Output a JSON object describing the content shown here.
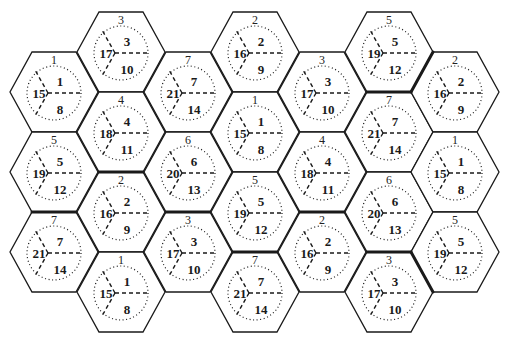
{
  "diagram": {
    "width": 510,
    "height": 345,
    "hex_half_width": 44,
    "hex_half_height": 40,
    "colors": {
      "background": "#ffffff",
      "stroke": "#1a1a1a",
      "text": "#1a1a1a"
    },
    "sector_rule": {
      "top_right": "n",
      "bottom_right": "n+7",
      "left": "n+14"
    },
    "cells": [
      {
        "id": "1",
        "cx": 54,
        "cy": 92,
        "cluster": "A",
        "sectors": {
          "top_right": "1",
          "left": "15",
          "bottom_right": "8"
        }
      },
      {
        "id": "5",
        "cx": 54,
        "cy": 172,
        "cluster": "A",
        "sectors": {
          "top_right": "5",
          "left": "19",
          "bottom_right": "12"
        }
      },
      {
        "id": "7",
        "cx": 54,
        "cy": 252,
        "cluster": "E",
        "sectors": {
          "top_right": "7",
          "left": "21",
          "bottom_right": "14"
        }
      },
      {
        "id": "3",
        "cx": 121,
        "cy": 52,
        "cluster": "A",
        "sectors": {
          "top_right": "3",
          "left": "17",
          "bottom_right": "10"
        }
      },
      {
        "id": "4",
        "cx": 121,
        "cy": 132,
        "cluster": "A",
        "sectors": {
          "top_right": "4",
          "left": "18",
          "bottom_right": "11"
        }
      },
      {
        "id": "2",
        "cx": 121,
        "cy": 212,
        "cluster": "E",
        "sectors": {
          "top_right": "2",
          "left": "16",
          "bottom_right": "9"
        }
      },
      {
        "id": "1",
        "cx": 121,
        "cy": 292,
        "cluster": "E",
        "sectors": {
          "top_right": "1",
          "left": "15",
          "bottom_right": "8"
        }
      },
      {
        "id": "7",
        "cx": 188,
        "cy": 92,
        "cluster": "B",
        "sectors": {
          "top_right": "7",
          "left": "21",
          "bottom_right": "14"
        }
      },
      {
        "id": "6",
        "cx": 188,
        "cy": 172,
        "cluster": "B",
        "sectors": {
          "top_right": "6",
          "left": "20",
          "bottom_right": "13"
        }
      },
      {
        "id": "3",
        "cx": 188,
        "cy": 252,
        "cluster": "E",
        "sectors": {
          "top_right": "3",
          "left": "17",
          "bottom_right": "10"
        }
      },
      {
        "id": "2",
        "cx": 255,
        "cy": 52,
        "cluster": "B",
        "sectors": {
          "top_right": "2",
          "left": "16",
          "bottom_right": "9"
        }
      },
      {
        "id": "1",
        "cx": 255,
        "cy": 132,
        "cluster": "B",
        "sectors": {
          "top_right": "1",
          "left": "15",
          "bottom_right": "8"
        }
      },
      {
        "id": "5",
        "cx": 255,
        "cy": 212,
        "cluster": "B",
        "sectors": {
          "top_right": "5",
          "left": "19",
          "bottom_right": "12"
        }
      },
      {
        "id": "7",
        "cx": 255,
        "cy": 292,
        "cluster": "F",
        "sectors": {
          "top_right": "7",
          "left": "21",
          "bottom_right": "14"
        }
      },
      {
        "id": "3",
        "cx": 322,
        "cy": 92,
        "cluster": "B",
        "sectors": {
          "top_right": "3",
          "left": "17",
          "bottom_right": "10"
        }
      },
      {
        "id": "4",
        "cx": 322,
        "cy": 172,
        "cluster": "B",
        "sectors": {
          "top_right": "4",
          "left": "18",
          "bottom_right": "11"
        }
      },
      {
        "id": "2",
        "cx": 322,
        "cy": 252,
        "cluster": "F",
        "sectors": {
          "top_right": "2",
          "left": "16",
          "bottom_right": "9"
        }
      },
      {
        "id": "5",
        "cx": 389,
        "cy": 52,
        "cluster": "D",
        "sectors": {
          "top_right": "5",
          "left": "19",
          "bottom_right": "12"
        }
      },
      {
        "id": "7",
        "cx": 389,
        "cy": 132,
        "cluster": "C",
        "sectors": {
          "top_right": "7",
          "left": "21",
          "bottom_right": "14"
        }
      },
      {
        "id": "6",
        "cx": 389,
        "cy": 212,
        "cluster": "C",
        "sectors": {
          "top_right": "6",
          "left": "20",
          "bottom_right": "13"
        }
      },
      {
        "id": "3",
        "cx": 389,
        "cy": 292,
        "cluster": "F",
        "sectors": {
          "top_right": "3",
          "left": "17",
          "bottom_right": "10"
        }
      },
      {
        "id": "2",
        "cx": 455,
        "cy": 92,
        "cluster": "C",
        "sectors": {
          "top_right": "2",
          "left": "16",
          "bottom_right": "9"
        }
      },
      {
        "id": "1",
        "cx": 455,
        "cy": 172,
        "cluster": "C",
        "sectors": {
          "top_right": "1",
          "left": "15",
          "bottom_right": "8"
        }
      },
      {
        "id": "5",
        "cx": 455,
        "cy": 252,
        "cluster": "C",
        "sectors": {
          "top_right": "5",
          "left": "19",
          "bottom_right": "12"
        }
      }
    ]
  }
}
